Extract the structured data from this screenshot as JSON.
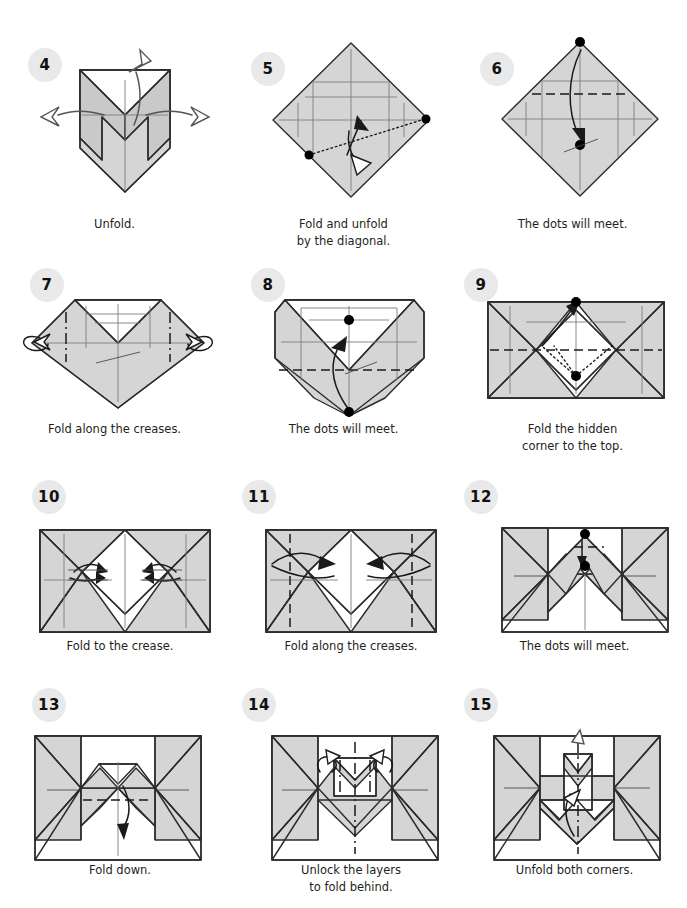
{
  "document": {
    "type": "origami-instructions",
    "page_width": 687,
    "page_height": 908,
    "background": "#ffffff",
    "paper_fill": "#d5d5d5",
    "paper_outline": "#2b2b2b",
    "badge_background": "#e9e9e9",
    "badge_text_color": "#111111",
    "caption_color": "#231f20"
  },
  "steps": [
    {
      "number": "4",
      "caption": "Unfold."
    },
    {
      "number": "5",
      "caption": "Fold and unfold\nby the diagonal."
    },
    {
      "number": "6",
      "caption": "The dots will meet."
    },
    {
      "number": "7",
      "caption": "Fold along the creases."
    },
    {
      "number": "8",
      "caption": "The dots will meet."
    },
    {
      "number": "9",
      "caption": "Fold the hidden\ncorner to the top."
    },
    {
      "number": "10",
      "caption": "Fold to the crease."
    },
    {
      "number": "11",
      "caption": "Fold along the creases."
    },
    {
      "number": "12",
      "caption": "The dots will meet."
    },
    {
      "number": "13",
      "caption": "Fold down."
    },
    {
      "number": "14",
      "caption": "Unlock the layers\nto fold behind."
    },
    {
      "number": "15",
      "caption": "Unfold both corners."
    }
  ]
}
